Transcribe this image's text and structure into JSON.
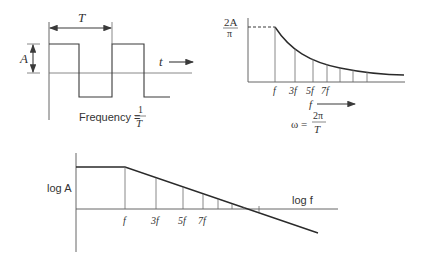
{
  "diagram": {
    "square_wave": {
      "period_label": "T",
      "amplitude_label": "A",
      "time_label": "t",
      "frequency_label": "Frequency =",
      "frequency_numerator": "1",
      "frequency_denominator": "T"
    },
    "linear_spectrum": {
      "y_label_numerator": "2A",
      "y_label_denominator": "π",
      "tick_labels": [
        "f",
        "3f",
        "5f",
        "7f"
      ],
      "x_axis_label": "f",
      "omega_label": "ω =",
      "omega_numerator": "2π",
      "omega_denominator": "T"
    },
    "log_spectrum": {
      "y_label": "log A",
      "x_label": "log f",
      "tick_labels": [
        "f",
        "3f",
        "5f",
        "7f"
      ]
    }
  },
  "colors": {
    "line": "#3a3a3a",
    "background": "#ffffff"
  }
}
